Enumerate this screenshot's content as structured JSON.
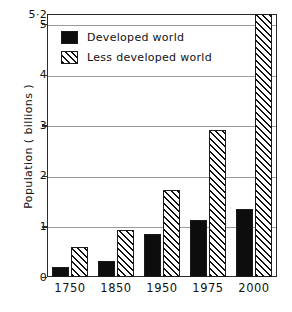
{
  "chart_data": {
    "type": "bar",
    "title": "",
    "subtitle": "",
    "xlabel": "",
    "ylabel": "Population  ( billions )",
    "categories": [
      "1750",
      "1850",
      "1950",
      "1975",
      "2000"
    ],
    "series": [
      {
        "name": "Developed world",
        "fill": "solid",
        "color": "#0d0d0d",
        "values": [
          0.2,
          0.32,
          0.85,
          1.12,
          1.35
        ]
      },
      {
        "name": "Less developed world",
        "fill": "hatched",
        "color": "#111111",
        "values": [
          0.6,
          0.92,
          1.72,
          2.9,
          5.2
        ]
      }
    ],
    "ylim": [
      0,
      5.2
    ],
    "yticks": [
      0,
      1,
      2,
      3,
      4,
      5,
      5.2
    ],
    "ytick_labels": [
      "0",
      "1",
      "2",
      "3",
      "4",
      "5",
      "5·2"
    ],
    "grid": "horizontal",
    "legend_position": "upper-left-inside",
    "axis_color": "#2b2b2b",
    "grid_color": "#9a9a9a",
    "background": "#ffffff"
  },
  "legend": {
    "items": [
      {
        "label": "Developed world",
        "swatch": "solid-black-square"
      },
      {
        "label": "Less developed world",
        "swatch": "hatched-diagonal-square"
      }
    ]
  }
}
